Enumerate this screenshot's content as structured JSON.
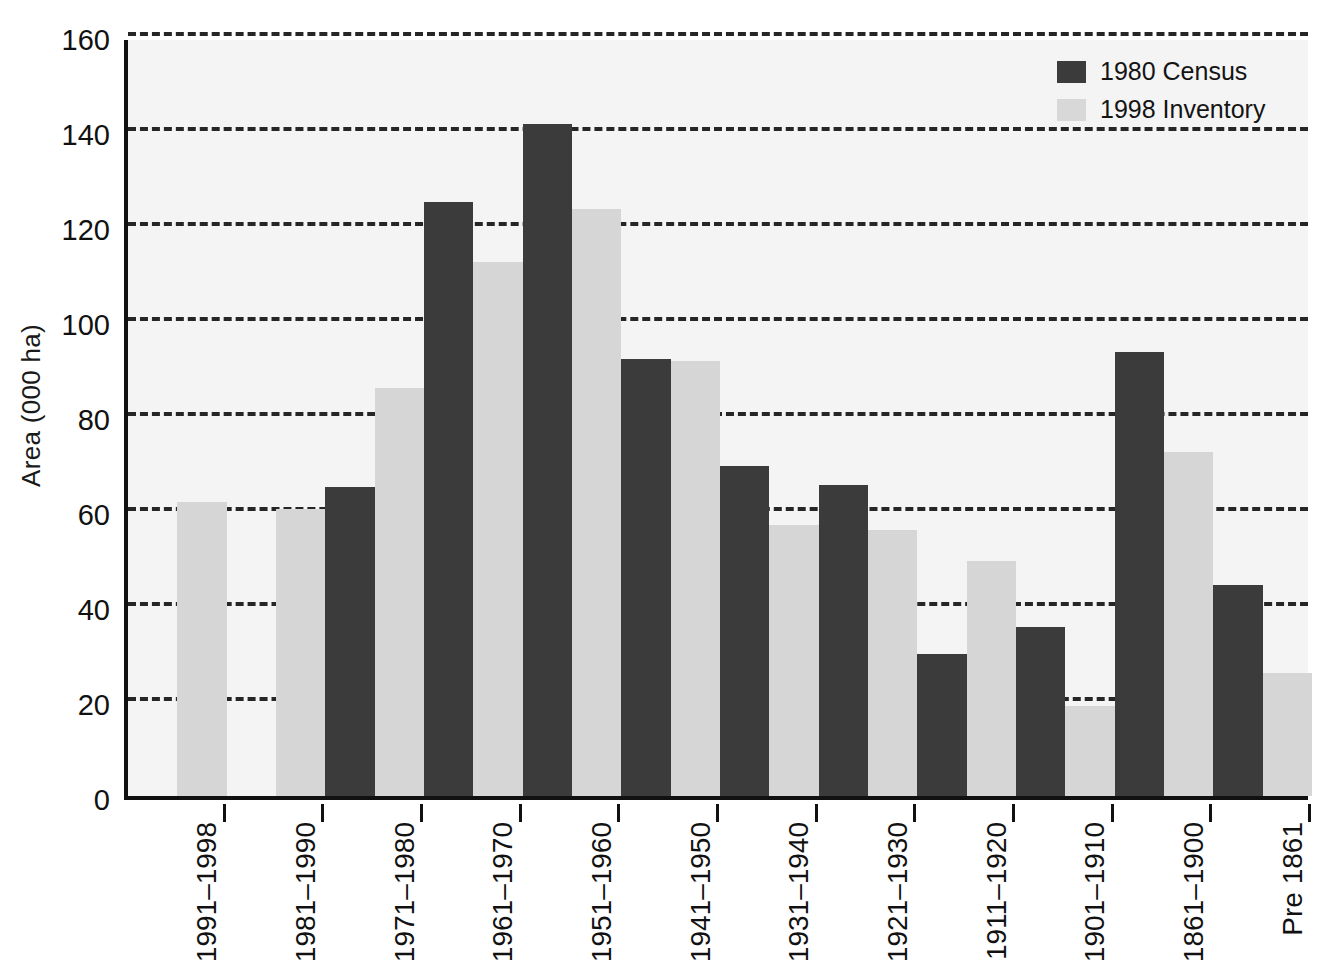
{
  "chart_data": {
    "type": "bar",
    "title": "",
    "subtitle": "",
    "xlabel": "",
    "ylabel": "Area (000 ha)",
    "ylim": [
      0,
      160
    ],
    "yticks": [
      0,
      20,
      40,
      60,
      80,
      100,
      120,
      140,
      160
    ],
    "ytick_labels": [
      "0",
      "20",
      "40",
      "60",
      "80",
      "100",
      "120",
      "140",
      "160"
    ],
    "grid": true,
    "grid_style": "dashed-horizontal",
    "legend_position": "top-right",
    "categories": [
      "1991–1998",
      "1981–1990",
      "1971–1980",
      "1961–1970",
      "1951–1960",
      "1941–1950",
      "1931–1940",
      "1921–1930",
      "1911–1920",
      "1901–1910",
      "1861–1900",
      "Pre 1861"
    ],
    "series": [
      {
        "name": "1980 Census",
        "color": "#3b3b3b",
        "values": [
          null,
          null,
          65,
          125,
          141.5,
          92,
          69.5,
          65.5,
          30,
          35.5,
          93.5,
          44.5
        ]
      },
      {
        "name": "1998 Inventory",
        "color": "#d6d6d6",
        "values": [
          62,
          60.5,
          86,
          112.5,
          123.5,
          91.5,
          57,
          56,
          49.5,
          19,
          72.5,
          26
        ]
      }
    ]
  },
  "legend": {
    "entries": [
      {
        "label": "1980 Census",
        "swatch": "dark"
      },
      {
        "label": "1998 Inventory",
        "swatch": "light"
      }
    ]
  },
  "axes": {
    "y_title": "Area (000 ha)"
  }
}
